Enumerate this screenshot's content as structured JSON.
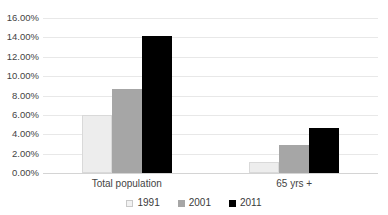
{
  "chart_data": {
    "type": "bar",
    "title": "",
    "xlabel": "",
    "ylabel": "",
    "categories": [
      "Total population",
      "65 yrs +"
    ],
    "series": [
      {
        "name": "1991",
        "values": [
          6.0,
          1.1
        ],
        "color": "#ededed"
      },
      {
        "name": "2001",
        "values": [
          8.7,
          2.9
        ],
        "color": "#a6a6a6"
      },
      {
        "name": "2011",
        "values": [
          14.1,
          4.6
        ],
        "color": "#000000"
      }
    ],
    "ylim": [
      0,
      16
    ],
    "ytick_values": [
      0,
      2,
      4,
      6,
      8,
      10,
      12,
      14,
      16
    ],
    "ytick_labels": [
      "0.00%",
      "2.00%",
      "4.00%",
      "6.00%",
      "8.00%",
      "10.00%",
      "12.00%",
      "14.00%",
      "16.00%"
    ],
    "value_format": "percent",
    "grid": true,
    "grid_axis": "y",
    "legend_position": "bottom",
    "legend_orientation": "horizontal"
  },
  "axis": {
    "yticks": [
      {
        "label": "16.00%",
        "value": 16
      },
      {
        "label": "14.00%",
        "value": 14
      },
      {
        "label": "12.00%",
        "value": 12
      },
      {
        "label": "10.00%",
        "value": 10
      },
      {
        "label": "8.00%",
        "value": 8
      },
      {
        "label": "6.00%",
        "value": 6
      },
      {
        "label": "4.00%",
        "value": 4
      },
      {
        "label": "2.00%",
        "value": 2
      },
      {
        "label": "0.00%",
        "value": 0
      }
    ],
    "categories": [
      {
        "label": "Total population"
      },
      {
        "label": "65 yrs +"
      }
    ]
  },
  "legend": {
    "items": [
      {
        "label": "1991"
      },
      {
        "label": "2001"
      },
      {
        "label": "2011"
      }
    ]
  }
}
